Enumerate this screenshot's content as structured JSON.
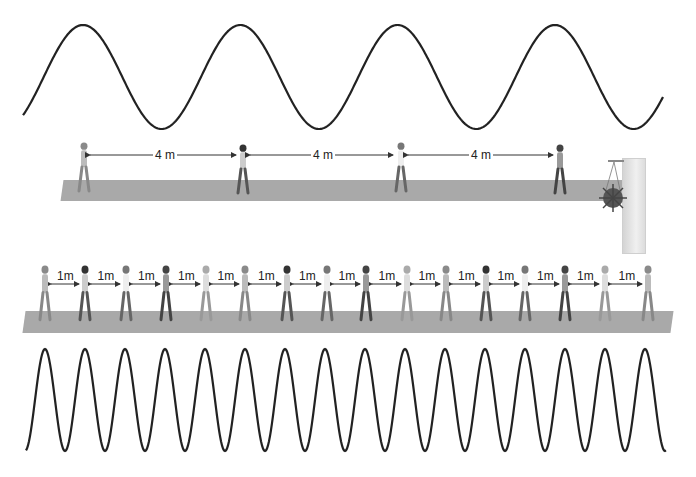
{
  "diagram": {
    "top_wave": {
      "cycles": 4,
      "description": "long wavelength, low frequency"
    },
    "top_walkway": {
      "walkers": 4,
      "spacing_labels": [
        "4 m",
        "4 m",
        "4 m"
      ],
      "object": "hanging plant on pillar"
    },
    "bottom_walkway": {
      "walkers": 17,
      "spacing_labels": [
        "1m",
        "1m",
        "1m",
        "1m",
        "1m",
        "1m",
        "1m",
        "1m",
        "1m",
        "1m",
        "1m",
        "1m",
        "1m",
        "1m",
        "1m",
        "1m"
      ]
    },
    "bottom_wave": {
      "cycles": 16,
      "description": "short wavelength, high frequency"
    },
    "colors": {
      "wave": "#222222",
      "walkway": "#a9a9a9",
      "pillar": "#e4e4e4"
    }
  }
}
